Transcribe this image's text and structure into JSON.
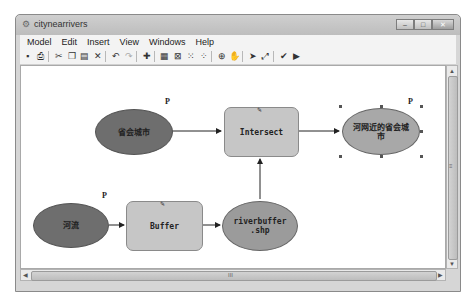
{
  "window": {
    "title": "citynearrivers",
    "app_icon": "model-icon",
    "controls": {
      "minimize": "–",
      "maximize": "□",
      "close": "✕"
    }
  },
  "menubar": {
    "items": [
      {
        "label": "Model"
      },
      {
        "label": "Edit"
      },
      {
        "label": "Insert"
      },
      {
        "label": "View"
      },
      {
        "label": "Windows"
      },
      {
        "label": "Help"
      }
    ]
  },
  "toolbar": {
    "buttons": [
      {
        "name": "save",
        "glyph": "▪"
      },
      {
        "name": "print",
        "glyph": "⎙"
      },
      {
        "name": "cut",
        "glyph": "✂"
      },
      {
        "name": "copy",
        "glyph": "❐"
      },
      {
        "name": "paste",
        "glyph": "▤"
      },
      {
        "name": "delete",
        "glyph": "✕"
      },
      {
        "name": "undo",
        "glyph": "↶"
      },
      {
        "name": "redo",
        "glyph": "↷"
      },
      {
        "name": "add-data",
        "glyph": "✚"
      },
      {
        "name": "auto-layout",
        "glyph": "▦"
      },
      {
        "name": "full-extent",
        "glyph": "⊠"
      },
      {
        "name": "zoom-in-fixed",
        "glyph": "⁙"
      },
      {
        "name": "zoom-out-fixed",
        "glyph": "⁘"
      },
      {
        "name": "zoom-in",
        "glyph": "⊕"
      },
      {
        "name": "pan",
        "glyph": "✋"
      },
      {
        "name": "select",
        "glyph": "➤"
      },
      {
        "name": "connect",
        "glyph": "⤢"
      },
      {
        "name": "validate",
        "glyph": "✔"
      },
      {
        "name": "run",
        "glyph": "▶"
      }
    ]
  },
  "model": {
    "nodes": {
      "capital_cities": {
        "label": "省会城市",
        "type": "input-data",
        "color": "#6e6e6e",
        "param_marker": "P"
      },
      "intersect": {
        "label": "Intersect",
        "type": "tool",
        "color": "#c6c6c6"
      },
      "output_cities": {
        "label": "河网近的省会城市",
        "type": "derived-data",
        "color": "#a8a8a8",
        "param_marker": "P",
        "selected": true
      },
      "rivers": {
        "label": "河流",
        "type": "input-data",
        "color": "#6e6e6e",
        "param_marker": "P"
      },
      "buffer": {
        "label": "Buffer",
        "type": "tool",
        "color": "#c6c6c6"
      },
      "riverbuffer": {
        "label": "riverbuffer .shp",
        "type": "derived-data",
        "color": "#9b9b9b"
      }
    }
  },
  "scrollbars": {
    "horizontal_grip": "III",
    "vertical_grip": "≡"
  }
}
